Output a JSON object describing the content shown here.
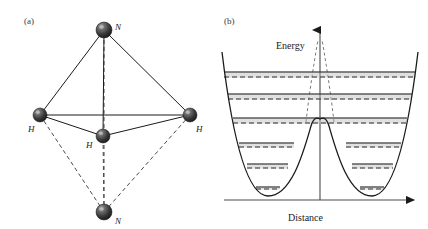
{
  "figure": {
    "caption_a": "(a)",
    "caption_b": "(b)"
  },
  "panel_a": {
    "label": "(a)",
    "description": "ammonia-inversion-geometry",
    "atoms": [
      {
        "id": "n-top",
        "element": "N",
        "label": "N",
        "cx": 104,
        "cy": 30,
        "r": 8.0,
        "label_x": 115,
        "label_y": 22
      },
      {
        "id": "h-left",
        "element": "H",
        "label": "H",
        "cx": 40,
        "cy": 115,
        "r": 7.0,
        "label_x": 28,
        "label_y": 124
      },
      {
        "id": "h-front",
        "element": "H",
        "label": "H",
        "cx": 103,
        "cy": 136,
        "r": 7.0,
        "label_x": 86,
        "label_y": 140
      },
      {
        "id": "h-right",
        "element": "H",
        "label": "H",
        "cx": 190,
        "cy": 115,
        "r": 7.0,
        "label_x": 196,
        "label_y": 124
      },
      {
        "id": "n-bottom",
        "element": "N",
        "label": "N",
        "cx": 104,
        "cy": 212,
        "r": 8.0,
        "label_x": 115,
        "label_y": 216
      }
    ],
    "solid_bonds": [
      {
        "from": "n-top",
        "to": "h-left"
      },
      {
        "from": "n-top",
        "to": "h-right"
      },
      {
        "from": "n-top",
        "to": "h-front"
      },
      {
        "from": "h-left",
        "to": "h-right"
      },
      {
        "from": "h-left",
        "to": "h-front"
      },
      {
        "from": "h-front",
        "to": "h-right"
      }
    ],
    "dashed_bonds": [
      {
        "from": "n-bottom",
        "to": "h-left"
      },
      {
        "from": "n-bottom",
        "to": "h-right"
      },
      {
        "from": "n-bottom",
        "to": "h-front"
      },
      {
        "from": "n-bottom",
        "to": "n-top"
      }
    ],
    "colors": {
      "sphere_dark": "#2e2e2e",
      "sphere_mid": "#555555",
      "sphere_light": "#9a9a9a",
      "bond_solid": "#1a1a1a",
      "bond_dashed": "#4a4a4a"
    }
  },
  "panel_b": {
    "label": "(b)",
    "description": "double-well-potential-with-tunneling-doublets",
    "axis": {
      "y_label": "Energy",
      "x_label": "Distance",
      "y_label_x": 276,
      "y_label_y": 40,
      "x_label_x": 288,
      "x_label_y": 212
    },
    "levels": [
      {
        "index": 6,
        "y": 72,
        "split": false,
        "left_x1": 224,
        "left_x2": 416,
        "right_x1": null,
        "right_x2": null,
        "dashed_y": 77
      },
      {
        "index": 5,
        "y": 94,
        "split": false,
        "left_x1": 228,
        "left_x2": 412,
        "right_x1": null,
        "right_x2": null,
        "dashed_y": 99
      },
      {
        "index": 4,
        "y": 118,
        "split": false,
        "left_x1": 233,
        "left_x2": 407,
        "right_x1": null,
        "right_x2": null,
        "dashed_y": 123
      },
      {
        "index": 3,
        "y": 143,
        "split": true,
        "left_x1": 239,
        "left_x2": 294,
        "right_x1": 346,
        "right_x2": 401,
        "dashed_y": 147
      },
      {
        "index": 2,
        "y": 164,
        "split": true,
        "left_x1": 247,
        "left_x2": 288,
        "right_x1": 352,
        "right_x2": 393,
        "dashed_y": 168
      },
      {
        "index": 1,
        "y": 187,
        "split": true,
        "left_x1": 256,
        "left_x2": 280,
        "right_x1": 360,
        "right_x2": 384,
        "dashed_y": 189
      }
    ],
    "colors": {
      "curve": "#1a1a1a",
      "level_solid": "#1a1a1a",
      "level_dashed": "#2a2a2a",
      "level_shade": "#b5b5b5",
      "axis": "#4a4a4a",
      "tunnel_dashed": "#6a6a6a"
    },
    "geometry": {
      "barrier_peak_y": 120,
      "well_bottom_y": 196,
      "left_well_center_x": 268,
      "right_well_center_x": 372,
      "center_x": 320,
      "baseline_y": 200
    }
  }
}
